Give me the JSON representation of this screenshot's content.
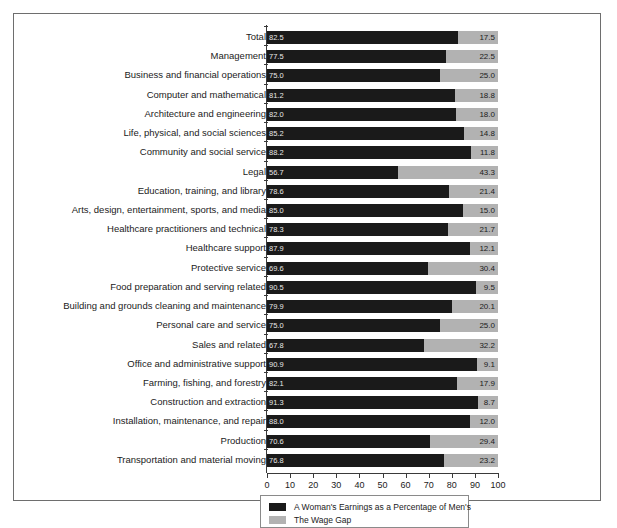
{
  "chart_data": {
    "type": "bar",
    "orientation": "horizontal",
    "stacked": true,
    "title": "",
    "subtitle": "",
    "xlabel": "",
    "ylabel": "",
    "xlim": [
      0,
      100
    ],
    "xticks": [
      0,
      10,
      20,
      30,
      40,
      50,
      60,
      70,
      80,
      90,
      100
    ],
    "grid": false,
    "legend_position": "bottom",
    "colors": {
      "earnings": "#1a1a1a",
      "wage_gap": "#b2b2b2",
      "frame": "#6e6e6e",
      "axis": "#3a3a3a",
      "in_bar_text": "#e8e8e8",
      "text": "#1b1b1b"
    },
    "categories": [
      "Total",
      "Management",
      "Business and financial operations",
      "Computer and mathematical",
      "Architecture and engineering",
      "Life, physical, and social sciences",
      "Community and social service",
      "Legal",
      "Education, training, and library",
      "Arts, design, entertainment, sports, and media",
      "Healthcare practitioners and technical",
      "Healthcare support",
      "Protective service",
      "Food preparation and serving related",
      "Building and grounds cleaning and maintenance",
      "Personal care and service",
      "Sales and related",
      "Office and administrative support",
      "Farming, fishing, and forestry",
      "Construction and extraction",
      "Installation, maintenance, and repair",
      "Production",
      "Transportation and material moving"
    ],
    "series": [
      {
        "name": "A Woman's Earnings as a Percentage of Men's",
        "color": "#1a1a1a",
        "values": [
          82.5,
          77.5,
          75.0,
          81.2,
          82.0,
          85.2,
          88.2,
          56.7,
          78.6,
          85.0,
          78.3,
          87.9,
          69.6,
          90.5,
          79.9,
          75.0,
          67.8,
          90.9,
          82.1,
          91.3,
          88.0,
          70.6,
          76.8
        ]
      },
      {
        "name": "The Wage Gap",
        "color": "#b2b2b2",
        "values": [
          17.5,
          22.5,
          25.0,
          18.8,
          18.0,
          14.8,
          11.8,
          43.3,
          21.4,
          15.0,
          21.7,
          12.1,
          30.4,
          9.5,
          20.1,
          25.0,
          32.2,
          9.1,
          17.9,
          8.7,
          12.0,
          29.4,
          23.2
        ]
      }
    ],
    "value_labels_inside": [
      "82.5",
      "77.5",
      "75.0",
      "81.2",
      "82.0",
      "85.2",
      "88.2",
      "56.7",
      "78.6",
      "85.0",
      "78.3",
      "87.9",
      "69.6",
      "90.5",
      "79.9",
      "75.0",
      "67.8",
      "90.9",
      "82.1",
      "91.3",
      "88.0",
      "70.6",
      "76.8"
    ],
    "value_labels_outside": [
      "17.5",
      "22.5",
      "25.0",
      "18.8",
      "18.0",
      "14.8",
      "11.8",
      "43.3",
      "21.4",
      "15.0",
      "21.7",
      "12.1",
      "30.4",
      "9.5",
      "20.1",
      "25.0",
      "32.2",
      "9.1",
      "17.9",
      "8.7",
      "12.0",
      "29.4",
      "23.2"
    ]
  },
  "legend": {
    "items": [
      {
        "label": "A Woman's Earnings as a Percentage of Men's",
        "color": "#1a1a1a"
      },
      {
        "label": "The Wage Gap",
        "color": "#b2b2b2"
      }
    ]
  },
  "axis": {
    "tick_labels": [
      "0",
      "10",
      "20",
      "30",
      "40",
      "50",
      "60",
      "70",
      "80",
      "90",
      "100"
    ]
  }
}
